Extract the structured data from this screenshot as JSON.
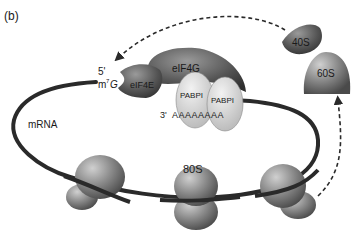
{
  "panel_label": "(b)",
  "labels": {
    "five_prime": "5'",
    "cap_m": "m",
    "cap_sup": "7",
    "cap_g": "G",
    "eif4e": "eIF4E",
    "eif4g": "eIF4G",
    "pabp1_a": "PABPI",
    "pabp1_b": "PABPI",
    "three_prime": "3'",
    "polyA": "A A A A A A A A",
    "mrna": "mRNA",
    "ribosome_80s": "80S",
    "subunit_40s": "40S",
    "subunit_60s": "60S"
  },
  "colors": {
    "mrna_strand": "#2a2a2a",
    "ribosome": "#8a8a8a",
    "eif4e": "#5a5a5a",
    "eif4g": "#6e6e6e",
    "pabp": "#d8d8d8",
    "arrow": "#2a2a2a"
  }
}
